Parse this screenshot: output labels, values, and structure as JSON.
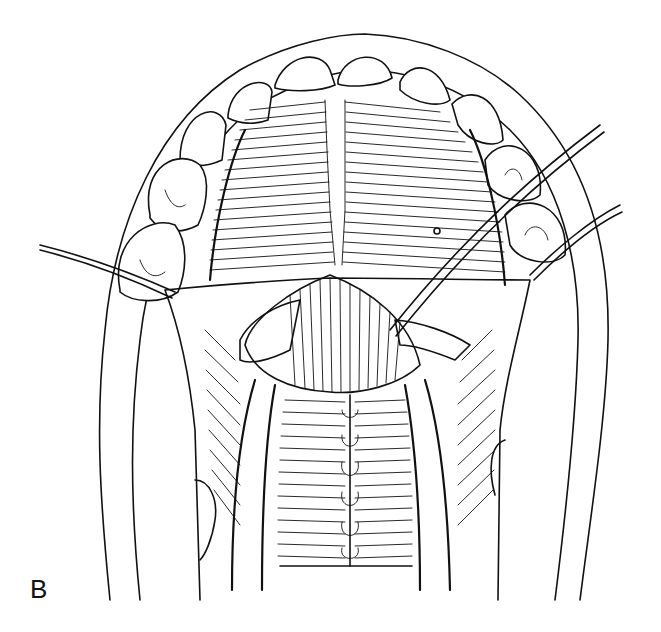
{
  "figure": {
    "panel_label": "B",
    "ink_color": "#111111",
    "background_color": "#ffffff"
  }
}
